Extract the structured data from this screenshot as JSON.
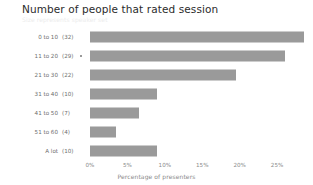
{
  "chart_data": {
    "type": "bar",
    "orientation": "horizontal",
    "title": "Number of people that rated session",
    "subtitle": "Size represents speaker set",
    "xlabel": "Percentage of presenters",
    "ylabel": "",
    "categories": [
      "0 to 10",
      "11 to 20",
      "21 to 30",
      "31 to 40",
      "41 to 50",
      "51 to 60",
      "A lot"
    ],
    "counts": [
      "(32)",
      "(29)",
      "(22)",
      "(10)",
      "(7)",
      "(4)",
      "(10)"
    ],
    "values": [
      28.6,
      26.0,
      19.5,
      8.9,
      6.5,
      3.5,
      9.0
    ],
    "xlim": [
      0,
      29
    ],
    "xticks": [
      0,
      5,
      10,
      15,
      20,
      25
    ],
    "xtick_labels": [
      "0%",
      "5%",
      "10%",
      "15%",
      "20%",
      "25%"
    ],
    "grid": false,
    "legend": "none",
    "bar_color": "#9a9a9a",
    "text_color": "#6d6d6d",
    "title_color": "#2b2b2b",
    "axis_color": "#8a8a8a",
    "background": "#ffffff",
    "row_marker_rows": [
      1
    ]
  }
}
